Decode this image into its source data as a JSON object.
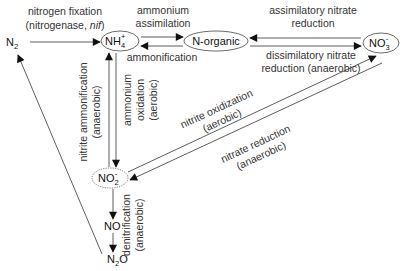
{
  "diagram": {
    "nodes": {
      "n2": {
        "label": "N",
        "sub": "2"
      },
      "nh4": {
        "label": "NH",
        "sub": "4",
        "sup": "+"
      },
      "norganic": {
        "label": "N-organic"
      },
      "no3": {
        "label": "NO",
        "sub": "3",
        "sup": "-"
      },
      "no2": {
        "label": "NO",
        "sub": "2",
        "sup": "-"
      },
      "no": {
        "label": "NO"
      },
      "n2o": {
        "label": "N",
        "sub": "2",
        "tail": "O"
      }
    },
    "processes": {
      "nitrogen_fixation": {
        "line1": "nitrogen fixation",
        "line2_pre": "(nitrogenase, ",
        "line2_italic": "nif",
        "line2_post": ")"
      },
      "ammonium_assimilation": {
        "line1": "ammonium",
        "line2": "assimilation"
      },
      "ammonification": {
        "line1": "ammonification"
      },
      "assimilatory_nitrate_reduction": {
        "line1": "assimilatory nitrate",
        "line2": "reduction"
      },
      "dissimilatory_nitrate_reduction": {
        "line1": "dissimilatory nitrate",
        "line2": "reduction (anaerobic)"
      },
      "nitrite_ammonification": {
        "line1": "nitrite ammonification",
        "line2": "(anaerobic)"
      },
      "ammonium_oxidation": {
        "line1": "ammonium",
        "line2": "oxidation",
        "line3": "(aerobic)"
      },
      "nitrite_oxidization": {
        "line1": "nitrite oxidization",
        "line2": "(aerobic)"
      },
      "nitrate_reduction": {
        "line1": "nitrate reduction",
        "line2": "(anaerobic)"
      },
      "denitrification": {
        "line1": "denitrification",
        "line2": "(anaerobic)"
      }
    }
  }
}
